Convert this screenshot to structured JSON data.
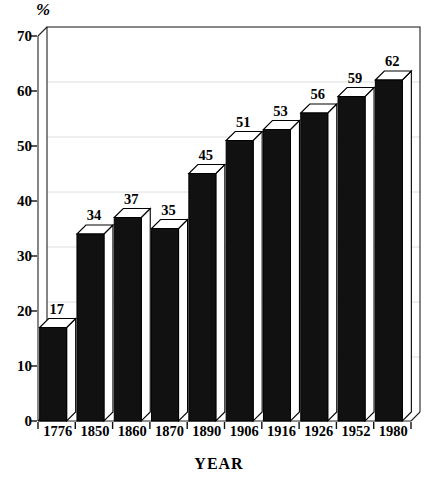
{
  "chart_data": {
    "type": "bar",
    "title": "",
    "subtitle": "",
    "xlabel": "YEAR",
    "ylabel": "%",
    "categories": [
      "1776",
      "1850",
      "1860",
      "1870",
      "1890",
      "1906",
      "1916",
      "1926",
      "1952",
      "1980"
    ],
    "values": [
      17,
      34,
      37,
      35,
      45,
      51,
      53,
      56,
      59,
      62
    ],
    "series": [
      {
        "name": "",
        "values": [
          17,
          34,
          37,
          35,
          45,
          51,
          53,
          56,
          59,
          62
        ]
      }
    ],
    "ylim": [
      0,
      70
    ],
    "yticks": [
      0,
      10,
      20,
      30,
      40,
      50,
      60,
      70
    ],
    "ytick_labels": [
      "0",
      "10",
      "20",
      "30",
      "40",
      "50",
      "60",
      "70"
    ],
    "grid": true,
    "grid_axis": "y",
    "legend": false,
    "legend_position": "none",
    "style": "3d-bar",
    "bar_face_color": "#111111",
    "bar_top_color": "#ffffff",
    "bar_side_color": "#ffffff",
    "bar_outline_color": "#000000",
    "grid_color": "#dedede",
    "axis_color": "#000000",
    "background_color": "#ffffff",
    "data_labels": [
      "17",
      "34",
      "37",
      "35",
      "45",
      "51",
      "53",
      "56",
      "59",
      "62"
    ]
  },
  "axes": {
    "y_unit": "%",
    "x_title": "YEAR"
  }
}
